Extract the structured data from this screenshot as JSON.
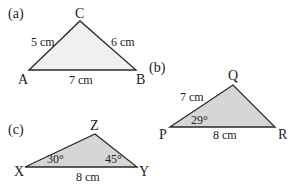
{
  "figures": [
    {
      "label": "(a)",
      "fill": "#f0f0f0",
      "vertices": {
        "A": [
          29,
          70
        ],
        "C": [
          80,
          21
        ],
        "B": [
          136,
          70
        ]
      },
      "vertex_labels": [
        "A",
        "C",
        "B"
      ],
      "sides": {
        "AC": "5 cm",
        "CB": "6 cm",
        "AB": "7 cm"
      }
    },
    {
      "label": "(b)",
      "fill": "#d6d6d6",
      "vertices": {
        "P": [
          170,
          127
        ],
        "Q": [
          233,
          85
        ],
        "R": [
          275,
          127
        ]
      },
      "vertex_labels": [
        "P",
        "Q",
        "R"
      ],
      "sides": {
        "PQ": "7 cm",
        "PR": "8 cm"
      },
      "angles": {
        "P": "29°"
      }
    },
    {
      "label": "(c)",
      "fill": "#d6d6d6",
      "vertices": {
        "X": [
          25,
          167
        ],
        "Z": [
          95,
          134
        ],
        "Y": [
          137,
          167
        ]
      },
      "vertex_labels": [
        "X",
        "Z",
        "Y"
      ],
      "sides": {
        "XY": "8 cm"
      },
      "angles": {
        "X": "30°",
        "Y": "45°"
      }
    }
  ],
  "stroke": "#2a2a2a"
}
